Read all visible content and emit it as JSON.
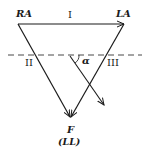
{
  "diagram": {
    "vertices": {
      "right_arm": "RA",
      "left_arm": "LA",
      "foot": "F",
      "foot_sub": "(LL)"
    },
    "leads": {
      "lead_1": "I",
      "lead_2": "II",
      "lead_3": "III"
    },
    "angle_label": "α",
    "colors": {
      "line": "#1a1a1a",
      "background": "#ffffff"
    }
  }
}
